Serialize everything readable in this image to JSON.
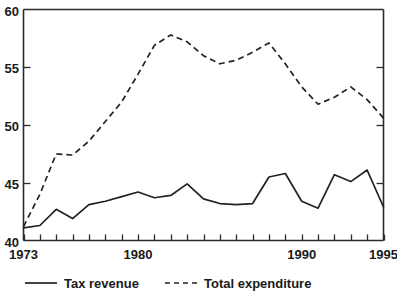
{
  "chart_data": {
    "type": "line",
    "title": "",
    "subtitle": "",
    "xlabel": "",
    "ylabel": "",
    "xlim": [
      1973,
      1995
    ],
    "ylim": [
      40,
      60
    ],
    "y_ticks": [
      40,
      45,
      50,
      55,
      60
    ],
    "y_tick_labels": [
      "40",
      "45",
      "50",
      "55",
      "60"
    ],
    "x_ticks": [
      1973,
      1974,
      1975,
      1976,
      1977,
      1978,
      1979,
      1980,
      1981,
      1982,
      1983,
      1984,
      1985,
      1986,
      1987,
      1988,
      1989,
      1990,
      1991,
      1992,
      1993,
      1994,
      1995
    ],
    "x_tick_labels_shown": [
      "1973",
      "1980",
      "1990",
      "1995"
    ],
    "x_labeled_ticks": [
      1973,
      1980,
      1990,
      1995
    ],
    "grid": false,
    "legend_position": "bottom",
    "x": [
      1973,
      1974,
      1975,
      1976,
      1977,
      1978,
      1979,
      1980,
      1981,
      1982,
      1983,
      1984,
      1985,
      1986,
      1987,
      1988,
      1989,
      1990,
      1991,
      1992,
      1993,
      1994,
      1995
    ],
    "series": [
      {
        "name": "Tax revenue",
        "style": "solid",
        "color": "#222222",
        "values": [
          41.1,
          41.3,
          42.7,
          41.9,
          43.1,
          43.4,
          43.8,
          44.2,
          43.7,
          43.9,
          44.9,
          43.6,
          43.2,
          43.1,
          43.2,
          45.5,
          45.8,
          43.4,
          42.8,
          45.7,
          45.1,
          46.1,
          42.9
        ]
      },
      {
        "name": "Total expenditure",
        "style": "dashed",
        "color": "#222222",
        "values": [
          41.2,
          44.0,
          47.5,
          47.4,
          48.6,
          50.3,
          52.0,
          54.4,
          56.9,
          57.8,
          57.2,
          56.0,
          55.3,
          55.6,
          56.3,
          57.1,
          55.3,
          53.3,
          51.8,
          52.4,
          53.3,
          52.2,
          50.6
        ]
      }
    ]
  },
  "legend": {
    "items": [
      {
        "label": "Tax revenue",
        "style": "solid"
      },
      {
        "label": "Total expenditure",
        "style": "dashed"
      }
    ]
  },
  "axes": {
    "y_labels": [
      "60",
      "55",
      "50",
      "45",
      "40"
    ],
    "x_labels": [
      "1973",
      "1980",
      "1990",
      "1995"
    ]
  }
}
